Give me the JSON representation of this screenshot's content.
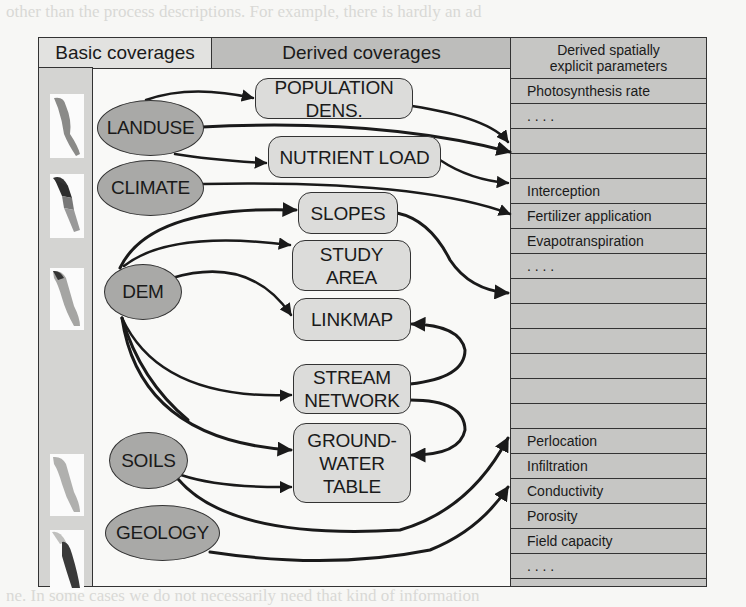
{
  "background_text": {
    "top_line": "other than the process descriptions. For example, there is hardly an ad",
    "bottom_line": "ne. In some cases we do not necessarily need that kind of information"
  },
  "header": {
    "basic_coverages": "Basic coverages",
    "derived_coverages": "Derived coverages",
    "derived_parameters_line1": "Derived spatially",
    "derived_parameters_line2": "explicit parameters"
  },
  "basic_coverages": [
    {
      "id": "landuse",
      "label": "LANDUSE"
    },
    {
      "id": "climate",
      "label": "CLIMATE"
    },
    {
      "id": "dem",
      "label": "DEM"
    },
    {
      "id": "soils",
      "label": "SOILS"
    },
    {
      "id": "geology",
      "label": "GEOLOGY"
    }
  ],
  "derived_coverages": [
    {
      "id": "population",
      "label": "POPULATION DENS."
    },
    {
      "id": "nutrient",
      "label": "NUTRIENT LOAD"
    },
    {
      "id": "slopes",
      "label": "SLOPES"
    },
    {
      "id": "study_area",
      "label_line1": "STUDY",
      "label_line2": "AREA"
    },
    {
      "id": "linkmap",
      "label": "LINKMAP"
    },
    {
      "id": "stream",
      "label_line1": "STREAM",
      "label_line2": "NETWORK"
    },
    {
      "id": "groundwater",
      "label_line1": "GROUND-",
      "label_line2": "WATER",
      "label_line3": "TABLE"
    }
  ],
  "parameters": [
    "Photosynthesis rate",
    ". . . .",
    "",
    "",
    "Interception",
    "Fertilizer application",
    "Evapotranspiration",
    ". . . .",
    "",
    "",
    "",
    "",
    "",
    "",
    "Perlocation",
    "Infiltration",
    "Conductivity",
    "Porosity",
    "Field capacity",
    ". . . .",
    ""
  ],
  "edges": [
    [
      "LANDUSE",
      "POPULATION DENS."
    ],
    [
      "LANDUSE",
      "NUTRIENT LOAD"
    ],
    [
      "LANDUSE",
      "parameters"
    ],
    [
      "CLIMATE",
      "parameters"
    ],
    [
      "DEM",
      "SLOPES"
    ],
    [
      "DEM",
      "STUDY AREA"
    ],
    [
      "DEM",
      "LINKMAP"
    ],
    [
      "DEM",
      "STREAM NETWORK"
    ],
    [
      "DEM",
      "GROUNDWATER TABLE"
    ],
    [
      "SOILS",
      "GROUNDWATER TABLE"
    ],
    [
      "SOILS",
      "parameters"
    ],
    [
      "GEOLOGY",
      "parameters"
    ],
    [
      "POPULATION DENS.",
      "parameters"
    ],
    [
      "NUTRIENT LOAD",
      "parameters"
    ],
    [
      "SLOPES",
      "parameters"
    ],
    [
      "STREAM NETWORK",
      "LINKMAP"
    ],
    [
      "STREAM NETWORK",
      "GROUNDWATER TABLE"
    ]
  ],
  "colors": {
    "ellipse_fill": "#a9a9a7",
    "box_fill": "#dcdcda",
    "table_fill": "#c6c6c4",
    "derived_header_fill": "#bdbdbb",
    "basic_header_fill": "#e2e2e0",
    "stroke": "#1a1a1a"
  }
}
